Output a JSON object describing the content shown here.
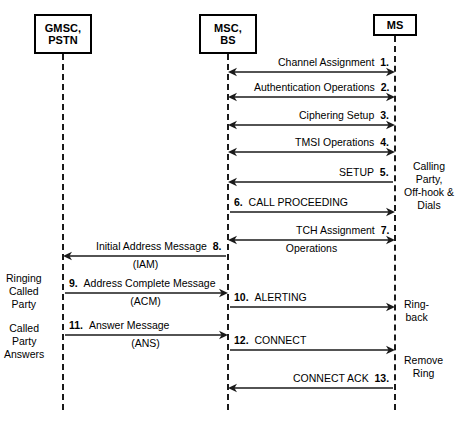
{
  "diagram": {
    "actors": [
      {
        "id": "gmsc",
        "line1": "GMSC,",
        "line2": "PSTN",
        "x": 63
      },
      {
        "id": "msc",
        "line1": "MSC,",
        "line2": "BS",
        "x": 228
      },
      {
        "id": "ms",
        "line1": "MS",
        "line2": "",
        "x": 395
      }
    ],
    "messages": [
      {
        "num": "1.",
        "label": "Channel Assignment",
        "sub": "",
        "from": "msc",
        "to": "ms",
        "dir": "both",
        "y": 72,
        "num_side": "right"
      },
      {
        "num": "2.",
        "label": "Authentication Operations",
        "sub": "",
        "from": "msc",
        "to": "ms",
        "dir": "both",
        "y": 97,
        "num_side": "right"
      },
      {
        "num": "3.",
        "label": "Ciphering Setup",
        "sub": "",
        "from": "msc",
        "to": "ms",
        "dir": "both",
        "y": 125,
        "num_side": "right"
      },
      {
        "num": "4.",
        "label": "TMSI Operations",
        "sub": "",
        "from": "msc",
        "to": "ms",
        "dir": "both",
        "y": 152,
        "num_side": "right"
      },
      {
        "num": "5.",
        "label": "SETUP",
        "sub": "",
        "from": "ms",
        "to": "msc",
        "dir": "left",
        "y": 182,
        "num_side": "right"
      },
      {
        "num": "6.",
        "label": "CALL PROCEEDING",
        "sub": "",
        "from": "msc",
        "to": "ms",
        "dir": "right",
        "y": 212,
        "num_side": "left"
      },
      {
        "num": "7.",
        "label": "TCH Assignment",
        "sub": "Operations",
        "from": "msc",
        "to": "ms",
        "dir": "both",
        "y": 240,
        "num_side": "right"
      },
      {
        "num": "8.",
        "label": "Initial Address Message",
        "sub": "(IAM)",
        "from": "msc",
        "to": "gmsc",
        "dir": "left",
        "y": 256,
        "num_side": "right"
      },
      {
        "num": "9.",
        "label": "Address Complete Message",
        "sub": "(ACM)",
        "from": "gmsc",
        "to": "msc",
        "dir": "right",
        "y": 293,
        "num_side": "left"
      },
      {
        "num": "10.",
        "label": "ALERTING",
        "sub": "",
        "from": "msc",
        "to": "ms",
        "dir": "right",
        "y": 307,
        "num_side": "left"
      },
      {
        "num": "11.",
        "label": "Answer Message",
        "sub": "(ANS)",
        "from": "gmsc",
        "to": "msc",
        "dir": "right",
        "y": 335,
        "num_side": "left"
      },
      {
        "num": "12.",
        "label": "CONNECT",
        "sub": "",
        "from": "msc",
        "to": "ms",
        "dir": "right",
        "y": 350,
        "num_side": "left"
      },
      {
        "num": "13.",
        "label": "CONNECT ACK",
        "sub": "",
        "from": "ms",
        "to": "msc",
        "dir": "left",
        "y": 388,
        "num_side": "right"
      }
    ],
    "annotations": [
      {
        "id": "calling-party",
        "side": "right",
        "text": "Calling\nParty,\nOff-hook &\nDials",
        "x": 404,
        "y": 160
      },
      {
        "id": "ringing-called-party",
        "side": "left",
        "text": "Ringing\nCalled\nParty",
        "x": 6,
        "y": 272
      },
      {
        "id": "ring-back",
        "side": "right",
        "text": "Ring-\nback",
        "x": 404,
        "y": 298
      },
      {
        "id": "called-party-answers",
        "side": "left",
        "text": "Called\nParty\nAnswers",
        "x": 4,
        "y": 322
      },
      {
        "id": "remove-ring",
        "side": "right",
        "text": "Remove\nRing",
        "x": 404,
        "y": 354
      }
    ],
    "colors": {
      "line": "#1a1a1a",
      "box_border": "#000000",
      "background": "#ffffff"
    }
  }
}
